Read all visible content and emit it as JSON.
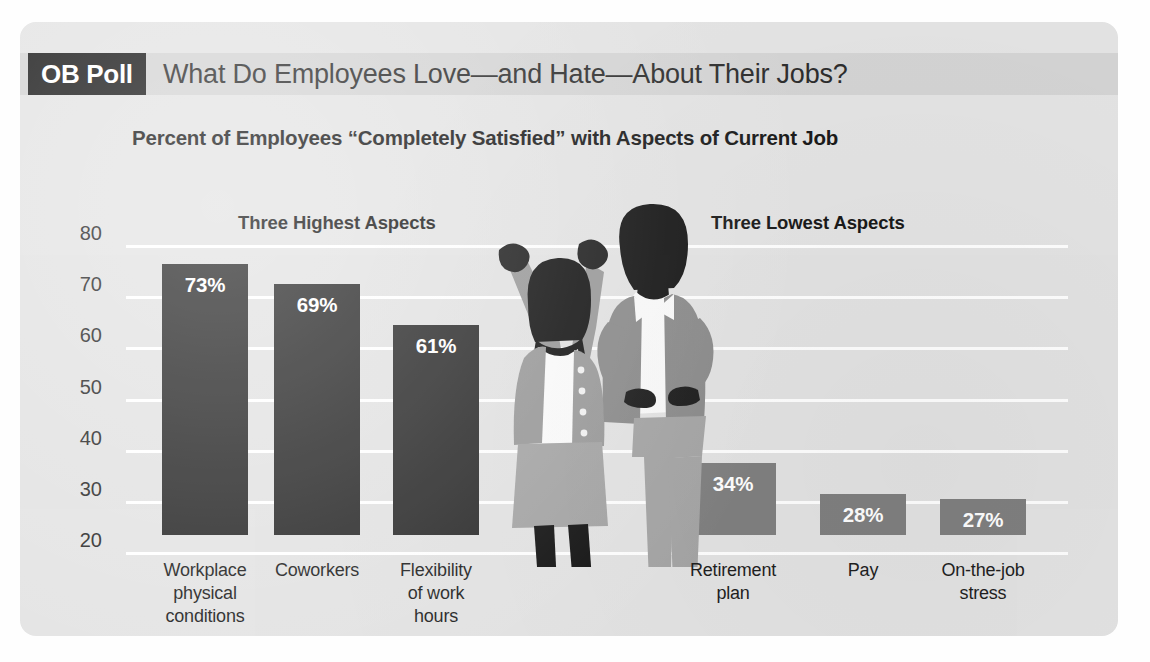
{
  "header": {
    "badge": "OB Poll",
    "title": "What Do Employees Love—and Hate—About Their Jobs?"
  },
  "subtitle": "Percent of Employees “Completely Satisfied” with Aspects of Current Job",
  "sections": {
    "high_label": "Three Highest Aspects",
    "low_label": "Three Lowest Aspects"
  },
  "colors": {
    "card_background": "#e3e3e3",
    "header_strip": "#d4d4d4",
    "badge_background": "#1c1c1c",
    "bar_high": "#2b2b2b",
    "bar_low": "#808080",
    "gridline": "#ffffff",
    "text": "#1b1b1b"
  },
  "chart_data": {
    "type": "bar",
    "title": "Percent of Employees “Completely Satisfied” with Aspects of Current Job",
    "xlabel": "",
    "ylabel": "",
    "ylim": [
      20,
      80
    ],
    "yticks": [
      80,
      70,
      60,
      50,
      40,
      30,
      20
    ],
    "ytick_labels": [
      "80",
      "70",
      "60",
      "50",
      "40",
      "30",
      "20"
    ],
    "grid": true,
    "legend": "none",
    "groups": [
      {
        "name": "Three Highest Aspects",
        "categories": [
          "Workplace physical conditions",
          "Coworkers",
          "Flexibility of work hours"
        ]
      },
      {
        "name": "Three Lowest Aspects",
        "categories": [
          "Retirement plan",
          "Pay",
          "On-the-job stress"
        ]
      }
    ],
    "categories": [
      "Workplace physical conditions",
      "Coworkers",
      "Flexibility of work hours",
      "Retirement plan",
      "Pay",
      "On-the-job stress"
    ],
    "values": [
      73,
      69,
      61,
      34,
      28,
      27
    ],
    "data_labels": [
      "73%",
      "69%",
      "61%",
      "34%",
      "28%",
      "27%"
    ],
    "bars": [
      {
        "category": "Workplace physical conditions",
        "label_lines": [
          "Workplace",
          "physical",
          "conditions"
        ],
        "value": 73,
        "data_label": "73%",
        "group": "high",
        "color": "#2b2b2b"
      },
      {
        "category": "Coworkers",
        "label_lines": [
          "Coworkers"
        ],
        "value": 69,
        "data_label": "69%",
        "group": "high",
        "color": "#2b2b2b"
      },
      {
        "category": "Flexibility of work hours",
        "label_lines": [
          "Flexibility",
          "of work",
          "hours"
        ],
        "value": 61,
        "data_label": "61%",
        "group": "high",
        "color": "#2b2b2b"
      },
      {
        "category": "Retirement plan",
        "label_lines": [
          "Retirement",
          "plan"
        ],
        "value": 34,
        "data_label": "34%",
        "group": "low",
        "color": "#808080"
      },
      {
        "category": "Pay",
        "label_lines": [
          "Pay"
        ],
        "value": 28,
        "data_label": "28%",
        "group": "low",
        "color": "#808080"
      },
      {
        "category": "On-the-job stress",
        "label_lines": [
          "On-the-job",
          "stress"
        ],
        "value": 27,
        "data_label": "27%",
        "group": "low",
        "color": "#808080"
      }
    ]
  },
  "illustration": {
    "left_figure": "celebrating-woman-arms-raised",
    "right_figure": "person-hands-on-hips"
  }
}
